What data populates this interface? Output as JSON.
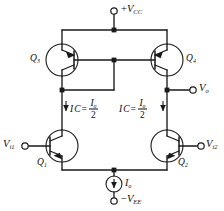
{
  "figure": {
    "type": "schematic",
    "line_color": "#1a1a1a",
    "text_color": "#0c0c0c",
    "background": "#ffffff"
  },
  "rails": {
    "positive_supply": {
      "sign": "+",
      "name": "V",
      "subscript": "CC"
    },
    "negative_supply": {
      "sign": "−",
      "name": "V",
      "subscript": "EE"
    }
  },
  "transistors": [
    {
      "id": "q3",
      "name": "Q",
      "subscript": "3",
      "type": "pnp",
      "role": "mirror-diode-connected"
    },
    {
      "id": "q4",
      "name": "Q",
      "subscript": "4",
      "type": "pnp",
      "role": "mirror-output"
    },
    {
      "id": "q1",
      "name": "Q",
      "subscript": "1",
      "type": "npn",
      "role": "input-left"
    },
    {
      "id": "q2",
      "name": "Q",
      "subscript": "2",
      "type": "npn",
      "role": "input-right"
    }
  ],
  "ports": {
    "input_left": {
      "name": "V",
      "subscript": "i1"
    },
    "input_right": {
      "name": "V",
      "subscript": "i2"
    },
    "output": {
      "name": "V",
      "subscript": "o"
    }
  },
  "current_source": {
    "name": "I",
    "subscript": "o"
  },
  "annotations": {
    "collector_current_left": {
      "symbol": "I",
      "symbol_sub": "C",
      "equals": "=",
      "numerator": "I",
      "numerator_sub": "o",
      "denominator": "2",
      "arrow": "down"
    },
    "collector_current_right": {
      "symbol": "I",
      "symbol_sub": "C",
      "equals": "=",
      "numerator": "I",
      "numerator_sub": "o",
      "denominator": "2",
      "arrow": "down"
    }
  }
}
